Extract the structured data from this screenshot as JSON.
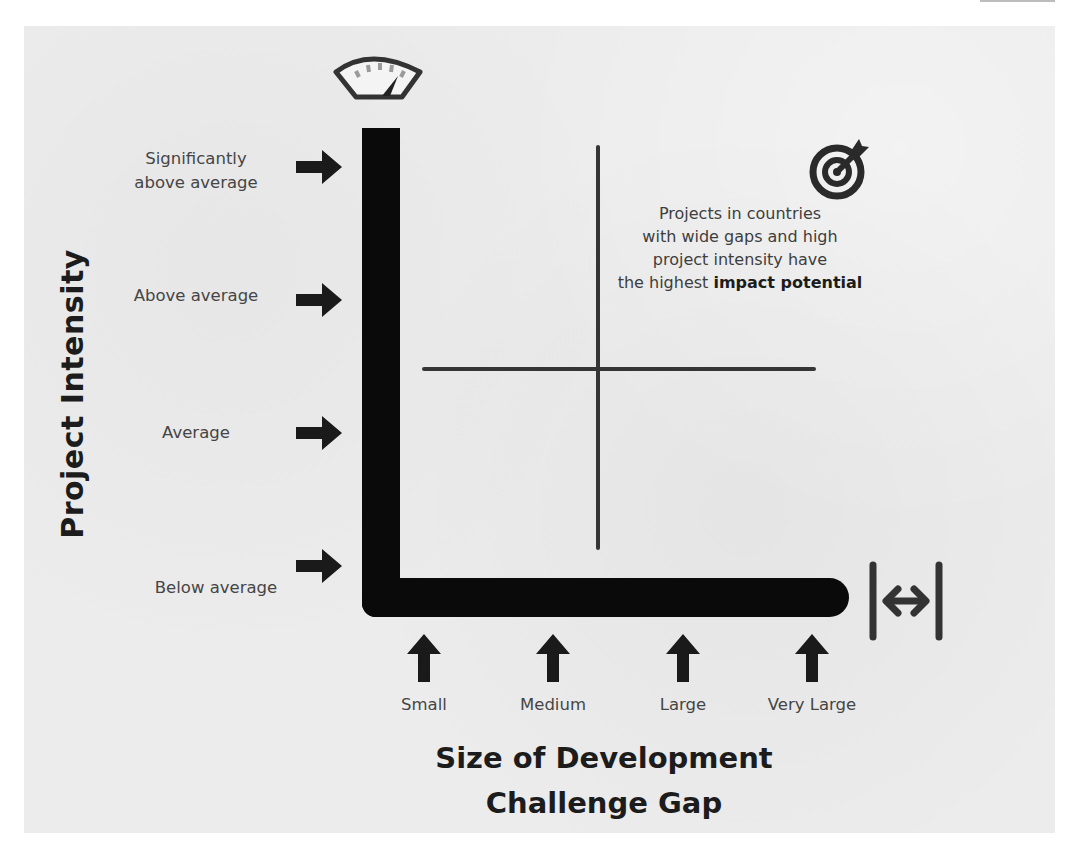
{
  "diagram": {
    "type": "quadrant-axes",
    "y_axis": {
      "title": "Project Intensity",
      "icon": "gauge-icon",
      "levels": [
        {
          "line1": "Significantly",
          "line2": "above average"
        },
        {
          "line1": "Above average",
          "line2": ""
        },
        {
          "line1": "Average",
          "line2": ""
        },
        {
          "line1": "Below average",
          "line2": ""
        }
      ]
    },
    "x_axis": {
      "title_line1": "Size of Development",
      "title_line2": "Challenge Gap",
      "icon": "width-arrows-icon",
      "levels": [
        "Small",
        "Medium",
        "Large",
        "Very Large"
      ]
    },
    "callout": {
      "icon": "target-icon",
      "line1": "Projects in countries",
      "line2": "with wide gaps and high",
      "line3": "project intensity have",
      "line4_prefix": "the highest ",
      "line4_bold": "impact potential"
    },
    "colors": {
      "background": "#ececec",
      "axis_bar": "#0a0a0a",
      "crosshair": "#353535",
      "label_text": "#454545",
      "title_text": "#1c1c1c",
      "gauge_ticks": "#9a9a9a"
    }
  }
}
